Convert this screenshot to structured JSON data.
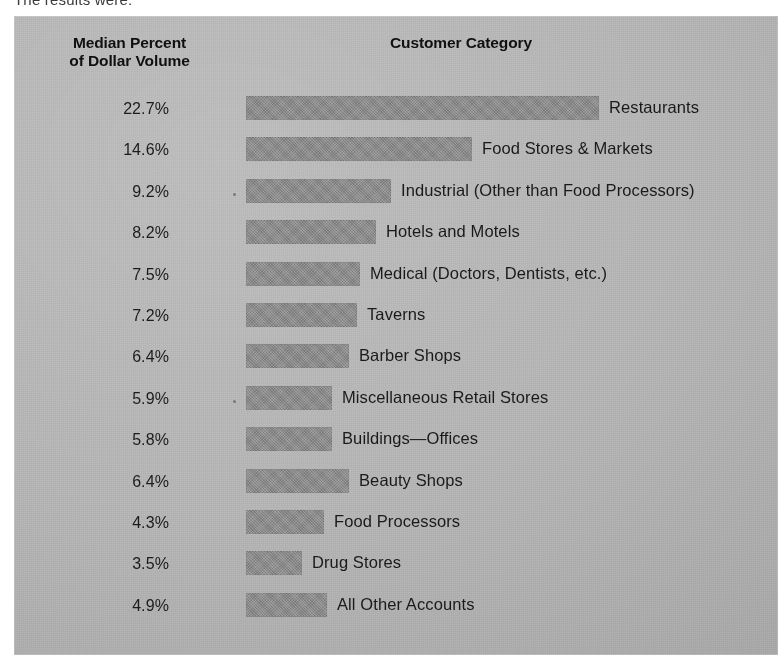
{
  "caption_clipped": "The results were:",
  "headers": {
    "value_axis_line1": "Median Percent",
    "value_axis_line2": "of Dollar Volume",
    "category_axis": "Customer Category"
  },
  "colors": {
    "panel_background": "#b4b4b4",
    "bar_fill": "#8b8b8b",
    "text": "#1a1a1a",
    "page_background": "#ffffff"
  },
  "chart_data": {
    "type": "bar",
    "orientation": "horizontal",
    "title": "Customer Category",
    "xlabel": "",
    "ylabel": "Median Percent of Dollar Volume",
    "grid": false,
    "legend": false,
    "value_suffix": "%",
    "xlim": [
      0,
      22.7
    ],
    "categories": [
      "Restaurants",
      "Food Stores & Markets",
      "Industrial (Other than Food Processors)",
      "Hotels and Motels",
      "Medical (Doctors, Dentists, etc.)",
      "Taverns",
      "Barber Shops",
      "Miscellaneous Retail Stores",
      "Buildings—Offices",
      "Beauty Shops",
      "Food Processors",
      "Drug Stores",
      "All Other Accounts"
    ],
    "values": [
      22.7,
      14.6,
      9.2,
      8.2,
      7.5,
      7.2,
      6.4,
      5.9,
      5.8,
      6.4,
      4.3,
      3.5,
      4.9
    ],
    "value_labels": [
      "22.7%",
      "14.6%",
      "9.2%",
      "8.2%",
      "7.5%",
      "7.2%",
      "6.4%",
      "5.9%",
      "5.8%",
      "6.4%",
      "4.3%",
      "3.5%",
      "4.9%"
    ],
    "bar_pixel_widths": [
      353,
      226,
      145,
      130,
      114,
      111,
      103,
      86,
      86,
      103,
      78,
      56,
      81
    ]
  }
}
